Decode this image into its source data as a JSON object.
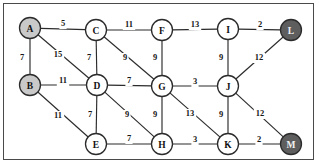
{
  "figure": {
    "background_color": "#ffffff",
    "border_color": "#4a4a4a",
    "edge_color": "#2b2b2b",
    "node_stroke_color": "#2b2b2b",
    "node_fill_white": "#ffffff",
    "node_fill_light": "#c9c9c9",
    "node_fill_dark": "#5e5e5e",
    "node_radius": 10.5
  },
  "chart_data": {
    "type": "diagram",
    "diagram_kind": "weighted-undirected-graph",
    "title": "",
    "nodes": [
      {
        "id": "A",
        "label": "A",
        "x": 30,
        "y": 28,
        "fill": "light"
      },
      {
        "id": "B",
        "label": "B",
        "x": 30,
        "y": 85,
        "fill": "light"
      },
      {
        "id": "C",
        "label": "C",
        "x": 96,
        "y": 30,
        "fill": "white"
      },
      {
        "id": "D",
        "label": "D",
        "x": 97,
        "y": 85,
        "fill": "white"
      },
      {
        "id": "E",
        "label": "E",
        "x": 96,
        "y": 144,
        "fill": "white"
      },
      {
        "id": "F",
        "label": "F",
        "x": 162,
        "y": 30,
        "fill": "white"
      },
      {
        "id": "G",
        "label": "G",
        "x": 162,
        "y": 86,
        "fill": "white"
      },
      {
        "id": "H",
        "label": "H",
        "x": 162,
        "y": 144,
        "fill": "white"
      },
      {
        "id": "I",
        "label": "I",
        "x": 228,
        "y": 29,
        "fill": "white"
      },
      {
        "id": "J",
        "label": "J",
        "x": 228,
        "y": 86,
        "fill": "white"
      },
      {
        "id": "K",
        "label": "K",
        "x": 228,
        "y": 144,
        "fill": "white"
      },
      {
        "id": "L",
        "label": "L",
        "x": 291,
        "y": 30,
        "fill": "dark"
      },
      {
        "id": "M",
        "label": "M",
        "x": 291,
        "y": 144,
        "fill": "dark"
      }
    ],
    "edges": [
      {
        "from": "A",
        "to": "C",
        "weight": "5",
        "lx": 63,
        "ly": 24
      },
      {
        "from": "C",
        "to": "F",
        "weight": "11",
        "lx": 129,
        "ly": 25
      },
      {
        "from": "F",
        "to": "I",
        "weight": "13",
        "lx": 195,
        "ly": 25
      },
      {
        "from": "I",
        "to": "L",
        "weight": "2",
        "lx": 260,
        "ly": 25
      },
      {
        "from": "A",
        "to": "B",
        "weight": "7",
        "lx": 22,
        "ly": 58
      },
      {
        "from": "A",
        "to": "D",
        "weight": "15",
        "lx": 58,
        "ly": 55
      },
      {
        "from": "C",
        "to": "D",
        "weight": "7",
        "lx": 89,
        "ly": 58
      },
      {
        "from": "C",
        "to": "G",
        "weight": "9",
        "lx": 125,
        "ly": 58
      },
      {
        "from": "F",
        "to": "G",
        "weight": "9",
        "lx": 155,
        "ly": 58
      },
      {
        "from": "I",
        "to": "J",
        "weight": "9",
        "lx": 221,
        "ly": 58
      },
      {
        "from": "J",
        "to": "L",
        "weight": "12",
        "lx": 259,
        "ly": 58
      },
      {
        "from": "B",
        "to": "D",
        "weight": "11",
        "lx": 63,
        "ly": 81
      },
      {
        "from": "D",
        "to": "G",
        "weight": "7",
        "lx": 129,
        "ly": 81
      },
      {
        "from": "G",
        "to": "J",
        "weight": "3",
        "lx": 195,
        "ly": 82
      },
      {
        "from": "B",
        "to": "E",
        "weight": "11",
        "lx": 58,
        "ly": 116
      },
      {
        "from": "D",
        "to": "E",
        "weight": "7",
        "lx": 90,
        "ly": 115
      },
      {
        "from": "D",
        "to": "H",
        "weight": "9",
        "lx": 127,
        "ly": 115
      },
      {
        "from": "G",
        "to": "H",
        "weight": "9",
        "lx": 155,
        "ly": 115
      },
      {
        "from": "G",
        "to": "K",
        "weight": "13",
        "lx": 190,
        "ly": 114
      },
      {
        "from": "J",
        "to": "K",
        "weight": "9",
        "lx": 221,
        "ly": 115
      },
      {
        "from": "J",
        "to": "M",
        "weight": "12",
        "lx": 260,
        "ly": 114
      },
      {
        "from": "E",
        "to": "H",
        "weight": "7",
        "lx": 129,
        "ly": 139
      },
      {
        "from": "H",
        "to": "K",
        "weight": "3",
        "lx": 195,
        "ly": 140
      },
      {
        "from": "K",
        "to": "M",
        "weight": "2",
        "lx": 259,
        "ly": 140
      }
    ]
  }
}
